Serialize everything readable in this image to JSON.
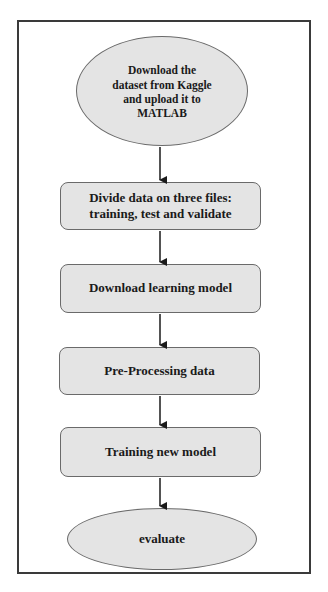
{
  "diagram": {
    "type": "flowchart",
    "colors": {
      "node_fill": "#e4e4e4",
      "node_border": "#6a6a6a",
      "frame_border": "#3a3a3a",
      "arrow": "#1a1a1a",
      "text": "#1a1a1a"
    },
    "nodes": [
      {
        "id": "start",
        "shape": "ellipse",
        "label": "Download the\ndataset from Kaggle\nand upload it to\nMATLAB"
      },
      {
        "id": "divide",
        "shape": "rounded-rect",
        "label": "Divide data on three files:\ntraining, test and validate"
      },
      {
        "id": "download-model",
        "shape": "rounded-rect",
        "label": "Download learning model"
      },
      {
        "id": "preprocess",
        "shape": "rounded-rect",
        "label": "Pre-Processing data"
      },
      {
        "id": "train",
        "shape": "rounded-rect",
        "label": "Training new model"
      },
      {
        "id": "evaluate",
        "shape": "ellipse",
        "label": "evaluate"
      }
    ],
    "edges": [
      {
        "from": "start",
        "to": "divide"
      },
      {
        "from": "divide",
        "to": "download-model"
      },
      {
        "from": "download-model",
        "to": "preprocess"
      },
      {
        "from": "preprocess",
        "to": "train"
      },
      {
        "from": "train",
        "to": "evaluate"
      }
    ]
  }
}
